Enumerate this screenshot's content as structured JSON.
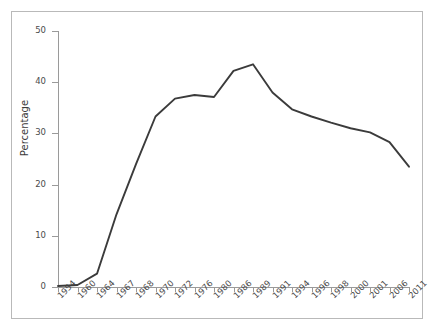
{
  "chart_data": {
    "type": "line",
    "title": "",
    "xlabel": "",
    "ylabel": "Percentage",
    "ylim": [
      0,
      50
    ],
    "yticks": [
      0,
      10,
      20,
      30,
      40,
      50
    ],
    "grid": false,
    "legend": "none",
    "line_color": "#3b3b3b",
    "categories": [
      "1954",
      "1960",
      "1964",
      "1967",
      "1968",
      "1970",
      "1972",
      "1976",
      "1980",
      "1986",
      "1989",
      "1991",
      "1994",
      "1996",
      "1998",
      "2000",
      "2001",
      "2006",
      "2011"
    ],
    "series": [
      {
        "name": "Percentage",
        "values": [
          0.2,
          0.4,
          2.6,
          14.2,
          24.0,
          33.3,
          36.8,
          37.5,
          37.1,
          42.2,
          43.5,
          38.0,
          34.7,
          33.3,
          32.1,
          31.0,
          30.2,
          28.3,
          23.5
        ]
      }
    ]
  },
  "axes": {
    "y_axis_title": "Percentage",
    "y_tick_labels": [
      "0",
      "10",
      "20",
      "30",
      "40",
      "50"
    ],
    "x_tick_labels": [
      "1954",
      "1960",
      "1964",
      "1967",
      "1968",
      "1970",
      "1972",
      "1976",
      "1980",
      "1986",
      "1989",
      "1991",
      "1994",
      "1996",
      "1998",
      "2000",
      "2001",
      "2006",
      "2011"
    ]
  }
}
